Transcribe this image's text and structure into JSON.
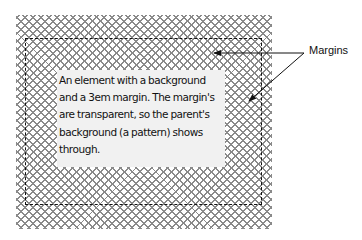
{
  "diagram": {
    "element_text": "An element with a background and a 3em margin. The margin's are transparent, so the parent's background (a pattern) shows through.",
    "element_lines": [
      "An element with a background",
      "and a 3em margin. The margin's",
      "are transparent, so the parent's",
      "background (a pattern) shows",
      "through."
    ],
    "callout_label": "Margins",
    "colors": {
      "pattern": "#8a8a8a",
      "element_background": "#f1f1f1",
      "border": "#111111",
      "page_background": "#ffffff"
    }
  }
}
